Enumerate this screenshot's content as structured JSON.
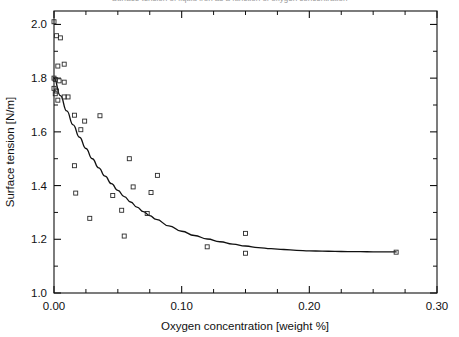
{
  "figure": {
    "clipped_title_fragment": "Surface tension of liquid iron as a function of oxygen concentration",
    "background_color": "#ffffff",
    "ink_color": "#111111"
  },
  "chart_data": {
    "type": "scatter",
    "title": "",
    "xlabel": "Oxygen concentration [weight %]",
    "ylabel": "Surface tension [N/m]",
    "xlim": [
      0.0,
      0.3
    ],
    "ylim": [
      1.0,
      2.05
    ],
    "grid": false,
    "legend": null,
    "x_ticks": [
      0.0,
      0.1,
      0.2,
      0.3
    ],
    "x_tick_labels": [
      "0.00",
      "0.10",
      "0.20",
      "0.30"
    ],
    "x_minor_tick_step": 0.025,
    "y_ticks": [
      1.0,
      1.2,
      1.4,
      1.6,
      1.8,
      2.0
    ],
    "y_tick_labels": [
      "1.0",
      "1.2",
      "1.4",
      "1.6",
      "1.8",
      "2.0"
    ],
    "y_minor_tick_step": 0.1,
    "tick_direction": "in",
    "marker_style": "open-square",
    "marker_size": 4,
    "series": [
      {
        "name": "Measured surface tension",
        "type": "scatter",
        "points": [
          [
            0.0,
            2.01
          ],
          [
            0.002,
            1.958
          ],
          [
            0.005,
            1.95
          ],
          [
            0.003,
            1.845
          ],
          [
            0.008,
            1.852
          ],
          [
            0.0,
            1.8
          ],
          [
            0.001,
            1.795
          ],
          [
            0.004,
            1.79
          ],
          [
            0.008,
            1.785
          ],
          [
            0.0,
            1.762
          ],
          [
            0.002,
            1.752
          ],
          [
            0.001,
            1.742
          ],
          [
            0.008,
            1.73
          ],
          [
            0.011,
            1.73
          ],
          [
            0.003,
            1.718
          ],
          [
            0.016,
            1.662
          ],
          [
            0.036,
            1.66
          ],
          [
            0.024,
            1.64
          ],
          [
            0.021,
            1.608
          ],
          [
            0.016,
            1.474
          ],
          [
            0.059,
            1.5
          ],
          [
            0.081,
            1.438
          ],
          [
            0.017,
            1.372
          ],
          [
            0.062,
            1.395
          ],
          [
            0.046,
            1.363
          ],
          [
            0.076,
            1.374
          ],
          [
            0.053,
            1.308
          ],
          [
            0.073,
            1.296
          ],
          [
            0.028,
            1.278
          ],
          [
            0.055,
            1.212
          ],
          [
            0.15,
            1.222
          ],
          [
            0.12,
            1.172
          ],
          [
            0.15,
            1.148
          ],
          [
            0.268,
            1.152
          ]
        ]
      },
      {
        "name": "Fitted curve",
        "type": "line",
        "points": [
          [
            0.0,
            1.8
          ],
          [
            0.005,
            1.735
          ],
          [
            0.01,
            1.678
          ],
          [
            0.015,
            1.626
          ],
          [
            0.02,
            1.58
          ],
          [
            0.025,
            1.538
          ],
          [
            0.03,
            1.5
          ],
          [
            0.035,
            1.466
          ],
          [
            0.04,
            1.435
          ],
          [
            0.045,
            1.407
          ],
          [
            0.05,
            1.382
          ],
          [
            0.055,
            1.359
          ],
          [
            0.06,
            1.339
          ],
          [
            0.065,
            1.32
          ],
          [
            0.07,
            1.303
          ],
          [
            0.075,
            1.288
          ],
          [
            0.08,
            1.274
          ],
          [
            0.09,
            1.25
          ],
          [
            0.1,
            1.23
          ],
          [
            0.11,
            1.214
          ],
          [
            0.12,
            1.201
          ],
          [
            0.13,
            1.191
          ],
          [
            0.14,
            1.182
          ],
          [
            0.15,
            1.175
          ],
          [
            0.16,
            1.169
          ],
          [
            0.17,
            1.165
          ],
          [
            0.18,
            1.162
          ],
          [
            0.19,
            1.159
          ],
          [
            0.2,
            1.157
          ],
          [
            0.21,
            1.156
          ],
          [
            0.22,
            1.155
          ],
          [
            0.23,
            1.154
          ],
          [
            0.24,
            1.154
          ],
          [
            0.25,
            1.153
          ],
          [
            0.26,
            1.153
          ],
          [
            0.268,
            1.153
          ]
        ]
      }
    ]
  }
}
